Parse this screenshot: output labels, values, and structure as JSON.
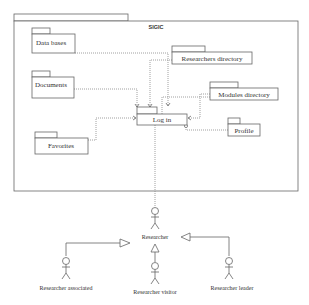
{
  "diagram": {
    "container": {
      "title": "SIGIC"
    },
    "packages": [
      {
        "id": "data-bases",
        "label": "Data bases"
      },
      {
        "id": "researchers-directory",
        "label": "Researchers directory"
      },
      {
        "id": "documents",
        "label": "Documents"
      },
      {
        "id": "modules-directory",
        "label": "Modules directory"
      },
      {
        "id": "log-in",
        "label": "Log in"
      },
      {
        "id": "profile",
        "label": "Profile"
      },
      {
        "id": "favorites",
        "label": "Favorites"
      }
    ],
    "actors": [
      {
        "id": "researcher",
        "label": "Researcher"
      },
      {
        "id": "researcher-associated",
        "label": "Researcher associated"
      },
      {
        "id": "researcher-visitor",
        "label": "Researcher visitor"
      },
      {
        "id": "researcher-leader",
        "label": "Researcher leader"
      }
    ],
    "relations": [
      {
        "from": "Data bases",
        "to": "Log in",
        "type": "dependency"
      },
      {
        "from": "Researchers directory",
        "to": "Log in",
        "type": "dependency"
      },
      {
        "from": "Documents",
        "to": "Log in",
        "type": "dependency"
      },
      {
        "from": "Modules directory",
        "to": "Log in",
        "type": "dependency"
      },
      {
        "from": "Favorites",
        "to": "Log in",
        "type": "dependency"
      },
      {
        "from": "Profile",
        "to": "Log in",
        "type": "dependency"
      },
      {
        "from": "Researcher",
        "to": "Log in",
        "type": "association"
      },
      {
        "from": "Researcher associated",
        "to": "Researcher",
        "type": "generalization"
      },
      {
        "from": "Researcher visitor",
        "to": "Researcher",
        "type": "generalization"
      },
      {
        "from": "Researcher leader",
        "to": "Researcher",
        "type": "generalization"
      }
    ]
  }
}
